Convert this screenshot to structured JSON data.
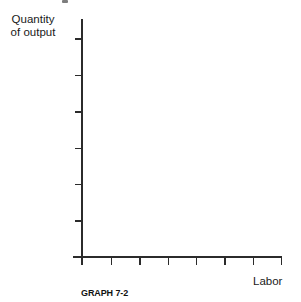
{
  "figure": {
    "y_axis_label_line1": "Quantity",
    "y_axis_label_line2": "of output",
    "x_axis_label": "Labor",
    "caption": "GRAPH 7-2"
  },
  "colors": {
    "axis": "#2b2b2b",
    "text": "#1a1a1a",
    "background": "#ffffff"
  },
  "chart_data": {
    "type": "line",
    "title": "",
    "xlabel": "Labor",
    "ylabel": "Quantity of output",
    "caption": "GRAPH 7-2",
    "series": [],
    "x_tick_count": 7,
    "y_tick_count": 6,
    "x_tick_labels": [],
    "y_tick_labels": [],
    "grid": false,
    "legend": false
  }
}
